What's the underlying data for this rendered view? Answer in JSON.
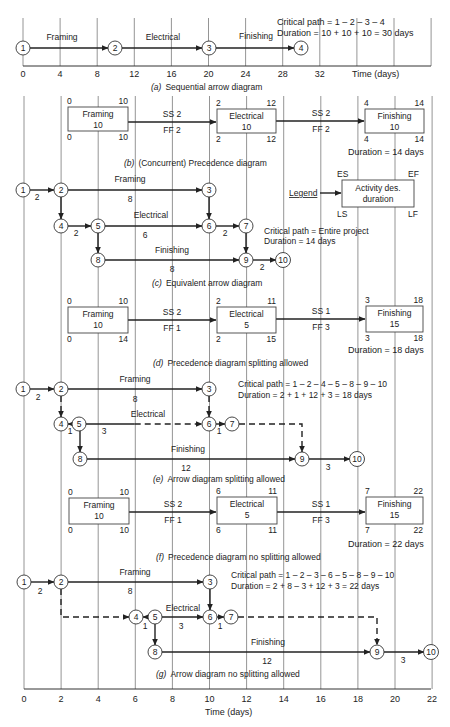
{
  "figure": {
    "time_axis_label": "Time (days)",
    "bottom_ticks": [
      "0",
      "2",
      "4",
      "6",
      "8",
      "10",
      "12",
      "14",
      "16",
      "18",
      "20",
      "22"
    ],
    "top_ticks": [
      "0",
      "4",
      "8",
      "12",
      "16",
      "20",
      "24",
      "28",
      "32"
    ]
  },
  "a": {
    "caption_letter": "(a)",
    "caption": "Sequential arrow diagram",
    "critical_path": "Critical path = 1 – 2 – 3 – 4",
    "duration": "Duration = 10 + 10 + 10 = 30 days",
    "nodes": [
      {
        "id": "1",
        "x": 23,
        "y": 48
      },
      {
        "id": "2",
        "x": 115,
        "y": 48
      },
      {
        "id": "3",
        "x": 209,
        "y": 48
      },
      {
        "id": "4",
        "x": 301,
        "y": 48
      }
    ],
    "arrows": [
      {
        "from": [
          30,
          48
        ],
        "to": [
          108,
          48
        ],
        "label": "Framing",
        "lx": 62,
        "ly": 40
      },
      {
        "from": [
          122,
          48
        ],
        "to": [
          202,
          48
        ],
        "label": "Electrical",
        "lx": 163,
        "ly": 40
      },
      {
        "from": [
          216,
          48
        ],
        "to": [
          294,
          48
        ],
        "label": "Finishing",
        "lx": 256,
        "ly": 39
      }
    ]
  },
  "b": {
    "caption_letter": "(b)",
    "caption": "(Concurrent) Precedence diagram",
    "duration": "Duration = 14 days",
    "boxes": [
      {
        "name": "Framing",
        "dur": "10",
        "x": 68,
        "y": 107,
        "w": 60,
        "h": 24,
        "es": "0",
        "ef": "10",
        "ls": "0",
        "lf": "10"
      },
      {
        "name": "Electrical",
        "dur": "10",
        "x": 217,
        "y": 109,
        "w": 59,
        "h": 24,
        "es": "2",
        "ef": "12",
        "ls": "2",
        "lf": "12"
      },
      {
        "name": "Finishing",
        "dur": "10",
        "x": 365,
        "y": 109,
        "w": 59,
        "h": 24,
        "es": "4",
        "ef": "14",
        "ls": "4",
        "lf": "14"
      }
    ],
    "links": [
      {
        "top": "SS 2",
        "bottom": "FF 2",
        "x1": 128,
        "x2": 216,
        "y": 122,
        "lx": 172
      },
      {
        "top": "SS 2",
        "bottom": "FF 2",
        "x1": 276,
        "x2": 364,
        "y": 121,
        "lx": 321
      }
    ]
  },
  "legend": {
    "label": "Legend",
    "box_line1": "Activity des.",
    "box_line2": "duration",
    "es": "ES",
    "ef": "EF",
    "ls": "LS",
    "lf": "LF"
  },
  "c": {
    "caption_letter": "(c)",
    "caption": "Equivalent arrow diagram",
    "critical_path": "Critical path = Entire project",
    "duration": "Duration = 14 days",
    "nodes": [
      {
        "id": "1",
        "x": 23,
        "y": 190
      },
      {
        "id": "2",
        "x": 61,
        "y": 190
      },
      {
        "id": "3",
        "x": 209,
        "y": 190
      },
      {
        "id": "4",
        "x": 61,
        "y": 226
      },
      {
        "id": "5",
        "x": 98,
        "y": 226
      },
      {
        "id": "6",
        "x": 209,
        "y": 226
      },
      {
        "id": "7",
        "x": 246,
        "y": 226
      },
      {
        "id": "8",
        "x": 98,
        "y": 260
      },
      {
        "id": "9",
        "x": 246,
        "y": 260
      },
      {
        "id": "10",
        "x": 283,
        "y": 260
      }
    ],
    "arrows": [
      {
        "from": [
          30,
          190
        ],
        "to": [
          54,
          190
        ],
        "label": "",
        "sub": "2",
        "sx": 37,
        "sy": 200
      },
      {
        "from": [
          68,
          190
        ],
        "to": [
          202,
          190
        ],
        "label": "Framing",
        "lx": 130,
        "ly": 182,
        "sub": "8",
        "sx": 130,
        "sy": 202
      },
      {
        "from": [
          61,
          197
        ],
        "to": [
          61,
          219
        ],
        "label": ""
      },
      {
        "from": [
          209,
          197
        ],
        "to": [
          209,
          219
        ],
        "label": ""
      },
      {
        "from": [
          68,
          226
        ],
        "to": [
          91,
          226
        ],
        "label": "",
        "sub": "2",
        "sx": 76,
        "sy": 236
      },
      {
        "from": [
          105,
          226
        ],
        "to": [
          202,
          226
        ],
        "label": "Electrical",
        "lx": 151,
        "ly": 218,
        "sub": "6",
        "sx": 145,
        "sy": 238
      },
      {
        "from": [
          216,
          226
        ],
        "to": [
          239,
          226
        ],
        "label": "",
        "sub": "2",
        "sx": 225,
        "sy": 236
      },
      {
        "from": [
          98,
          233
        ],
        "to": [
          98,
          253
        ],
        "label": ""
      },
      {
        "from": [
          246,
          233
        ],
        "to": [
          246,
          253
        ],
        "label": ""
      },
      {
        "from": [
          105,
          260
        ],
        "to": [
          239,
          260
        ],
        "label": "Finishing",
        "lx": 172,
        "ly": 253,
        "sub": "8",
        "sx": 172,
        "sy": 272
      },
      {
        "from": [
          253,
          260
        ],
        "to": [
          276,
          260
        ],
        "label": "",
        "sub": "2",
        "sx": 262,
        "sy": 270
      }
    ]
  },
  "d": {
    "caption_letter": "(d)",
    "caption": "Precedence diagram splitting allowed",
    "duration": "Duration = 18 days",
    "boxes": [
      {
        "name": "Framing",
        "dur": "10",
        "x": 68,
        "y": 307,
        "w": 60,
        "h": 26,
        "es": "0",
        "ef": "10",
        "ls": "0",
        "lf": "14"
      },
      {
        "name": "Electrical",
        "dur": "5",
        "x": 217,
        "y": 307,
        "w": 59,
        "h": 26,
        "es": "2",
        "ef": "11",
        "ls": "2",
        "lf": "15"
      },
      {
        "name": "Finishing",
        "dur": "15",
        "x": 366,
        "y": 306,
        "w": 57,
        "h": 26,
        "es": "3",
        "ef": "18",
        "ls": "3",
        "lf": "18"
      }
    ],
    "links": [
      {
        "top": "SS 2",
        "bottom": "FF 1",
        "x1": 128,
        "x2": 216,
        "y": 320,
        "lx": 172
      },
      {
        "top": "SS 1",
        "bottom": "FF 3",
        "x1": 276,
        "x2": 365,
        "y": 319,
        "lx": 321
      }
    ]
  },
  "e": {
    "caption_letter": "(e)",
    "caption": "Arrow diagram splitting allowed",
    "critical_path": "Critical path = 1 – 2 – 4 – 5 – 8 – 9 – 10",
    "duration": "Duration = 2 + 1 + 12 + 3 = 18 days",
    "nodes": [
      {
        "id": "1",
        "x": 23,
        "y": 389
      },
      {
        "id": "2",
        "x": 61,
        "y": 389
      },
      {
        "id": "3",
        "x": 209,
        "y": 389
      },
      {
        "id": "4",
        "x": 61,
        "y": 424
      },
      {
        "id": "5",
        "x": 79,
        "y": 424
      },
      {
        "id": "6",
        "x": 209,
        "y": 424
      },
      {
        "id": "7",
        "x": 232,
        "y": 424
      },
      {
        "id": "8",
        "x": 80,
        "y": 459
      },
      {
        "id": "9",
        "x": 302,
        "y": 459
      },
      {
        "id": "10",
        "x": 357,
        "y": 459
      }
    ],
    "arrows": [
      {
        "from": [
          30,
          389
        ],
        "to": [
          54,
          389
        ],
        "label": "",
        "sub": "2",
        "sx": 38,
        "sy": 400
      },
      {
        "from": [
          68,
          389
        ],
        "to": [
          202,
          389
        ],
        "label": "Framing",
        "lx": 135,
        "ly": 382,
        "sub": "8",
        "sx": 135,
        "sy": 402
      },
      {
        "from": [
          61,
          396
        ],
        "to": [
          61,
          417
        ],
        "label": "",
        "dashed": true
      },
      {
        "from": [
          209,
          396
        ],
        "to": [
          209,
          417
        ],
        "label": "",
        "dashed": true
      },
      {
        "from": [
          72,
          424
        ],
        "to": [
          68,
          424
        ],
        "label": "",
        "sub": "1",
        "sx": 70,
        "sy": 434
      },
      {
        "from": [
          86,
          424
        ],
        "to": [
          202,
          424
        ],
        "label": "Electrical",
        "lx": 148,
        "ly": 417,
        "sub": "3",
        "sx": 104,
        "sy": 434,
        "dashed_tail": true
      },
      {
        "from": [
          216,
          424
        ],
        "to": [
          225,
          424
        ],
        "label": "",
        "sub": "1",
        "sx": 219,
        "sy": 434
      },
      {
        "from": [
          80,
          431
        ],
        "to": [
          80,
          452
        ],
        "label": ""
      },
      {
        "from": [
          87,
          459
        ],
        "to": [
          295,
          459
        ],
        "label": "Finishing",
        "lx": 188,
        "ly": 452,
        "sub": "12",
        "sx": 186,
        "sy": 471
      },
      {
        "from": [
          309,
          459
        ],
        "to": [
          350,
          459
        ],
        "label": "",
        "sub": "3",
        "sx": 328,
        "sy": 470
      }
    ],
    "dashed_paths": [
      "M239 424 H302 V452"
    ]
  },
  "f": {
    "caption_letter": "(f)",
    "caption": "Precedence diagram no splitting allowed",
    "duration": "Duration = 22 days",
    "boxes": [
      {
        "name": "Framing",
        "dur": "10",
        "x": 69,
        "y": 498,
        "w": 60,
        "h": 26,
        "es": "0",
        "ef": "10",
        "ls": "0",
        "lf": "10"
      },
      {
        "name": "Electrical",
        "dur": "5",
        "x": 217,
        "y": 497,
        "w": 60,
        "h": 27,
        "es": "6",
        "ef": "11",
        "ls": "6",
        "lf": "11"
      },
      {
        "name": "Finishing",
        "dur": "15",
        "x": 366,
        "y": 497,
        "w": 57,
        "h": 27,
        "es": "7",
        "ef": "22",
        "ls": "7",
        "lf": "22"
      }
    ],
    "links": [
      {
        "top": "SS 2",
        "bottom": "FF 1",
        "x1": 129,
        "x2": 216,
        "y": 512,
        "lx": 173
      },
      {
        "top": "SS 1",
        "bottom": "FF 3",
        "x1": 277,
        "x2": 365,
        "y": 512,
        "lx": 321
      }
    ]
  },
  "g": {
    "caption_letter": "(g)",
    "caption": "Arrow diagram no splitting allowed",
    "critical_path": "Critical path = 1 – 2 – 3 – 6 – 5 – 8 – 9 – 10",
    "duration": "Duration = 2 + 8 – 3 + 12 + 3 = 22 days",
    "nodes": [
      {
        "id": "1",
        "x": 24,
        "y": 582
      },
      {
        "id": "2",
        "x": 61,
        "y": 582
      },
      {
        "id": "3",
        "x": 210,
        "y": 582
      },
      {
        "id": "4",
        "x": 136,
        "y": 617
      },
      {
        "id": "5",
        "x": 155,
        "y": 617
      },
      {
        "id": "6",
        "x": 210,
        "y": 617
      },
      {
        "id": "7",
        "x": 231,
        "y": 617
      },
      {
        "id": "8",
        "x": 155,
        "y": 652
      },
      {
        "id": "9",
        "x": 377,
        "y": 652
      },
      {
        "id": "10",
        "x": 431,
        "y": 652
      }
    ],
    "arrows": [
      {
        "from": [
          31,
          582
        ],
        "to": [
          54,
          582
        ],
        "label": "",
        "sub": "2",
        "sx": 40,
        "sy": 594
      },
      {
        "from": [
          68,
          582
        ],
        "to": [
          203,
          582
        ],
        "label": "Framing",
        "lx": 135,
        "ly": 575,
        "sub": "8",
        "sx": 130,
        "sy": 594
      },
      {
        "from": [
          210,
          589
        ],
        "to": [
          210,
          610
        ],
        "label": ""
      },
      {
        "from": [
          148,
          617
        ],
        "to": [
          143,
          617
        ],
        "label": "",
        "sub": "1",
        "sx": 145,
        "sy": 629
      },
      {
        "from": [
          162,
          617
        ],
        "to": [
          203,
          617
        ],
        "label": "Electrical",
        "lx": 183,
        "ly": 611,
        "sub": "3",
        "sx": 181,
        "sy": 629
      },
      {
        "from": [
          217,
          617
        ],
        "to": [
          224,
          617
        ],
        "label": "",
        "sub": "1",
        "sx": 220,
        "sy": 629
      },
      {
        "from": [
          155,
          624
        ],
        "to": [
          155,
          645
        ],
        "label": ""
      },
      {
        "from": [
          162,
          652
        ],
        "to": [
          370,
          652
        ],
        "label": "Finishing",
        "lx": 268,
        "ly": 645,
        "sub": "12",
        "sx": 267,
        "sy": 664
      },
      {
        "from": [
          384,
          652
        ],
        "to": [
          424,
          652
        ],
        "label": "",
        "sub": "3",
        "sx": 403,
        "sy": 663
      }
    ],
    "dashed_paths": [
      "M61 589 V617 H129",
      "M238 617 H377 V645"
    ]
  }
}
